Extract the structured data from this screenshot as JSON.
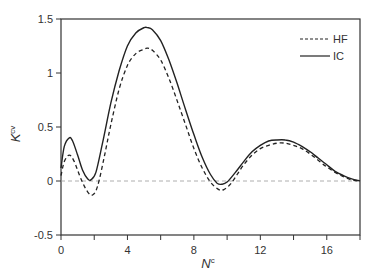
{
  "chart_data": {
    "type": "line",
    "title": "",
    "xlabel": "N",
    "xlabel_superscript": "c",
    "ylabel": "K",
    "ylabel_superscript": "cv",
    "xlim": [
      0,
      18
    ],
    "ylim": [
      -0.5,
      1.5
    ],
    "xticks": [
      0,
      2,
      4,
      6,
      8,
      10,
      12,
      14,
      16,
      18
    ],
    "xtick_labels": [
      "0",
      "",
      "4",
      "",
      "8",
      "",
      "12",
      "",
      "16",
      ""
    ],
    "yticks": [
      -0.5,
      0,
      0.5,
      1,
      1.5
    ],
    "ytick_labels": [
      "-0.5",
      "0",
      "0.5",
      "1",
      "1.5"
    ],
    "grid": false,
    "reference_line": {
      "y": 0,
      "style": "dashed",
      "color": "#999999"
    },
    "legend": {
      "position": "upper right",
      "entries": [
        "HF",
        "IC"
      ]
    },
    "series": [
      {
        "name": "HF",
        "style": "dashed",
        "color": "#222222",
        "x": [
          0.0,
          0.2,
          0.5,
          0.8,
          1.2,
          1.6,
          1.9,
          2.2,
          2.6,
          3.0,
          3.5,
          4.0,
          4.5,
          5.0,
          5.2,
          5.5,
          6.0,
          6.5,
          7.0,
          7.5,
          8.0,
          8.5,
          9.0,
          9.5,
          9.8,
          10.2,
          10.6,
          11.0,
          11.5,
          12.0,
          12.5,
          13.0,
          13.5,
          14.0,
          14.5,
          15.0,
          15.5,
          16.0,
          16.5,
          17.0,
          17.5,
          18.0
        ],
        "y": [
          0.05,
          0.18,
          0.24,
          0.18,
          0.02,
          -0.1,
          -0.13,
          -0.05,
          0.22,
          0.52,
          0.85,
          1.07,
          1.18,
          1.22,
          1.23,
          1.21,
          1.12,
          0.95,
          0.74,
          0.52,
          0.3,
          0.12,
          -0.01,
          -0.08,
          -0.08,
          -0.03,
          0.06,
          0.15,
          0.24,
          0.3,
          0.33,
          0.35,
          0.35,
          0.33,
          0.3,
          0.25,
          0.19,
          0.13,
          0.08,
          0.04,
          0.01,
          0.0
        ]
      },
      {
        "name": "IC",
        "style": "solid",
        "color": "#222222",
        "x": [
          0.0,
          0.2,
          0.5,
          0.7,
          1.0,
          1.3,
          1.6,
          1.8,
          2.1,
          2.5,
          3.0,
          3.5,
          4.0,
          4.5,
          5.0,
          5.2,
          5.5,
          6.0,
          6.5,
          7.0,
          7.5,
          8.0,
          8.5,
          9.0,
          9.4,
          9.7,
          10.0,
          10.5,
          11.0,
          11.5,
          12.0,
          12.5,
          13.0,
          13.5,
          14.0,
          14.5,
          15.0,
          15.5,
          16.0,
          16.5,
          17.0,
          17.5,
          18.0
        ],
        "y": [
          0.12,
          0.32,
          0.4,
          0.37,
          0.24,
          0.1,
          0.02,
          0.01,
          0.08,
          0.35,
          0.72,
          1.02,
          1.25,
          1.37,
          1.42,
          1.42,
          1.4,
          1.3,
          1.12,
          0.9,
          0.66,
          0.43,
          0.22,
          0.06,
          -0.02,
          -0.03,
          -0.01,
          0.08,
          0.18,
          0.27,
          0.33,
          0.37,
          0.38,
          0.38,
          0.36,
          0.32,
          0.27,
          0.21,
          0.15,
          0.09,
          0.05,
          0.02,
          0.0
        ]
      }
    ]
  }
}
